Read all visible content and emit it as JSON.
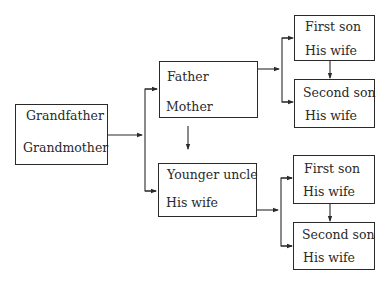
{
  "diagram": {
    "type": "family-tree-flow",
    "nodes": {
      "grandparents": {
        "top": "Grandfather",
        "bottom": "Grandmother"
      },
      "parents": {
        "top": "Father",
        "bottom": "Mother"
      },
      "uncle": {
        "top": "Younger uncle",
        "bottom": "His wife"
      },
      "parents_first_son": {
        "top": "First son",
        "bottom": "His wife"
      },
      "parents_second_son": {
        "top": "Second son",
        "bottom": "His wife"
      },
      "uncle_first_son": {
        "top": "First son",
        "bottom": "His wife"
      },
      "uncle_second_son": {
        "top": "Second son",
        "bottom": "His wife"
      }
    },
    "edges": [
      [
        "grandparents",
        "parents"
      ],
      [
        "grandparents",
        "uncle"
      ],
      [
        "parents",
        "uncle"
      ],
      [
        "parents",
        "parents_first_son"
      ],
      [
        "parents",
        "parents_second_son"
      ],
      [
        "parents_first_son",
        "parents_second_son"
      ],
      [
        "uncle",
        "uncle_first_son"
      ],
      [
        "uncle",
        "uncle_second_son"
      ],
      [
        "uncle_first_son",
        "uncle_second_son"
      ]
    ]
  }
}
